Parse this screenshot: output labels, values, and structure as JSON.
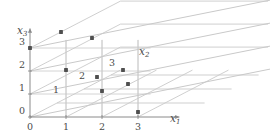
{
  "figure": {
    "kind": "3d-integer-lattice-axes-diagram",
    "axes": {
      "x1": {
        "label": "x",
        "sub": "1",
        "label_x": 170,
        "label_y": 122
      },
      "x2": {
        "label": "x",
        "sub": "2",
        "label_x": 139,
        "label_y": 55
      },
      "x3": {
        "label": "x",
        "sub": "3",
        "label_x": 17,
        "label_y": 34
      }
    },
    "x1_ticks": [
      {
        "text": "0",
        "x": 30,
        "y": 130
      },
      {
        "text": "1",
        "x": 66,
        "y": 130
      },
      {
        "text": "2",
        "x": 102,
        "y": 130
      },
      {
        "text": "3",
        "x": 138,
        "y": 130
      }
    ],
    "x3_ticks": [
      {
        "text": "0",
        "x": 22,
        "y": 114
      },
      {
        "text": "1",
        "x": 22,
        "y": 91
      },
      {
        "text": "2",
        "x": 22,
        "y": 68
      },
      {
        "text": "3",
        "x": 22,
        "y": 45
      }
    ],
    "x2_ticks": [
      {
        "text": "1",
        "x": 56,
        "y": 93
      },
      {
        "text": "2",
        "x": 82,
        "y": 79
      },
      {
        "text": "3",
        "x": 112,
        "y": 66
      }
    ],
    "geometry": {
      "origin_x": 30,
      "origin_y": 117,
      "unit_x1": 36,
      "unit_x3": 23,
      "x2_dx": 27,
      "x2_dy": -14,
      "axis_max": 3
    },
    "colors": {
      "grid": "#c9c9c9",
      "axis": "#8a8a8a",
      "point": "#4f4f4f",
      "text": "#4a4a4a",
      "background": "#ffffff"
    }
  },
  "chart_data": {
    "type": "scatter",
    "title": "",
    "xlabel": "x1",
    "ylabel": "x3",
    "zlabel": "x2",
    "projection": "axonometric-3d",
    "xlim": [
      0,
      3
    ],
    "ylim": [
      0,
      3
    ],
    "zlim": [
      0,
      3
    ],
    "xticks": [
      "0",
      "1",
      "2",
      "3"
    ],
    "yticks": [
      "0",
      "1",
      "2",
      "3"
    ],
    "zticks": [
      "1",
      "2",
      "3"
    ],
    "grid": true,
    "legend": false,
    "points_3d": [
      {
        "x1": 0,
        "x2": 0,
        "x3": 3
      },
      {
        "x1": 1,
        "x2": 0,
        "x3": 3
      },
      {
        "x1": 1,
        "x2": 0,
        "x3": 2
      },
      {
        "x1": 2,
        "x2": 0,
        "x3": 3
      },
      {
        "x1": 2,
        "x2": 0,
        "x3": 2
      },
      {
        "x1": 2,
        "x2": 0,
        "x3": 1
      },
      {
        "x1": 3,
        "x2": 0,
        "x3": 2
      },
      {
        "x1": 3,
        "x2": 0,
        "x3": 1
      },
      {
        "x1": 3,
        "x2": 0,
        "x3": 0
      }
    ],
    "points_screen": [
      {
        "x": 30,
        "y": 48,
        "label": ""
      },
      {
        "x": 61,
        "y": 32,
        "label": ""
      },
      {
        "x": 66,
        "y": 70,
        "label": ""
      },
      {
        "x": 92,
        "y": 38,
        "label": ""
      },
      {
        "x": 97,
        "y": 77,
        "label": ""
      },
      {
        "x": 102,
        "y": 91,
        "label": ""
      },
      {
        "x": 123,
        "y": 70,
        "label": ""
      },
      {
        "x": 128,
        "y": 84,
        "label": ""
      },
      {
        "x": 138,
        "y": 112,
        "label": ""
      }
    ]
  }
}
